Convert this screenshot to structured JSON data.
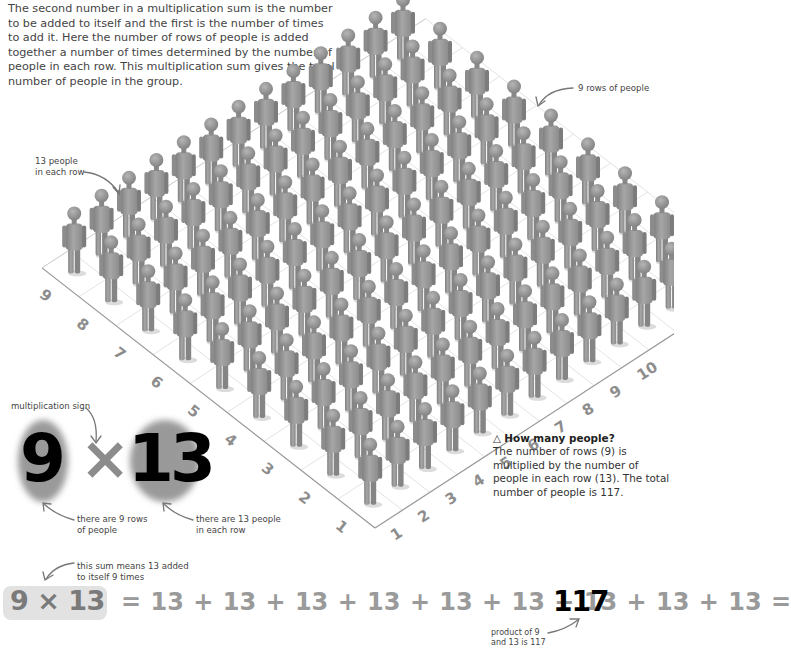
{
  "intro_text": "The second number in a multiplication sum is the number to be added to itself and the first is the number of times to add it. Here the number of rows of people is added together a number of times determined by the number of people in each row. This multiplication sum gives the total number of people in the group.",
  "annotations": {
    "people_per_row": [
      "13 people",
      "in each row"
    ],
    "rows_of_people": "9 rows of people",
    "multiplication_sign": "multiplication sign",
    "nine_rows": [
      "there are 9 rows",
      "of people"
    ],
    "thirteen_people": [
      "there are 13 people",
      "in each row"
    ],
    "sum_means": [
      "this sum means 13 added",
      "to itself 9 times"
    ],
    "product": [
      "product of 9",
      "and 13 is 117"
    ]
  },
  "big_equation": {
    "left": "9",
    "sign": "×",
    "right": "13"
  },
  "grid": {
    "rows": 9,
    "people_per_row": 13,
    "left_axis_labels": [
      "1",
      "2",
      "3",
      "4",
      "5",
      "6",
      "7",
      "8",
      "9"
    ],
    "right_axis_labels": [
      "1",
      "2",
      "3",
      "4",
      "5",
      "6",
      "7",
      "8",
      "9",
      "10"
    ],
    "figure_color": "#8f8f8f",
    "line_color": "#c8c8c8"
  },
  "caption": {
    "icon": "△",
    "title": "How many people?",
    "body": "The number of rows (9) is multiplied by the number of people in each row (13). The total number of people is 117."
  },
  "sum_equation": {
    "left": "9 × 13",
    "rest": "= 13 + 13 + 13 + 13 + 13 + 13 + 13 + 13 + 13 =",
    "result": "117"
  }
}
